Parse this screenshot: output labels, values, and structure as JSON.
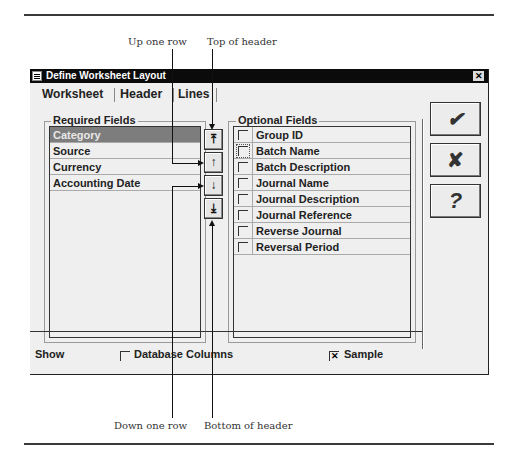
{
  "callouts": {
    "up_one_row": "Up one row",
    "top_of_header": "Top of header",
    "down_one_row": "Down one row",
    "bottom_of_header": "Bottom of header"
  },
  "dialog": {
    "title": "Define Worksheet Layout",
    "close_glyph": "✕",
    "tabs": [
      {
        "label": "Worksheet",
        "active": false
      },
      {
        "label": "Header",
        "active": true
      },
      {
        "label": "Lines",
        "active": false
      }
    ],
    "required_fields": {
      "label": "Required Fields",
      "items": [
        {
          "label": "Category",
          "selected": true
        },
        {
          "label": "Source",
          "selected": false
        },
        {
          "label": "Currency",
          "selected": false
        },
        {
          "label": "Accounting Date",
          "selected": false
        }
      ]
    },
    "order_buttons": [
      {
        "name": "top-of-header",
        "glyph": "⤒"
      },
      {
        "name": "up-one-row",
        "glyph": "↑"
      },
      {
        "name": "down-one-row",
        "glyph": "↓"
      },
      {
        "name": "bottom-of-header",
        "glyph": "⤓"
      }
    ],
    "optional_fields": {
      "label": "Optional Fields",
      "items": [
        {
          "label": "Group ID",
          "checked": false
        },
        {
          "label": "Batch Name",
          "checked": false,
          "focused": true
        },
        {
          "label": "Batch Description",
          "checked": false
        },
        {
          "label": "Journal Name",
          "checked": false
        },
        {
          "label": "Journal Description",
          "checked": false
        },
        {
          "label": "Journal Reference",
          "checked": false
        },
        {
          "label": "Reverse Journal",
          "checked": false
        },
        {
          "label": "Reversal Period",
          "checked": false
        }
      ]
    },
    "action_buttons": {
      "ok_glyph": "✔",
      "cancel_glyph": "✘",
      "help_glyph": "?"
    },
    "show": {
      "label": "Show",
      "database_columns": {
        "label": "Database Columns",
        "checked": false
      },
      "sample": {
        "label": "Sample",
        "checked": true,
        "check_glyph": "✕"
      }
    }
  }
}
